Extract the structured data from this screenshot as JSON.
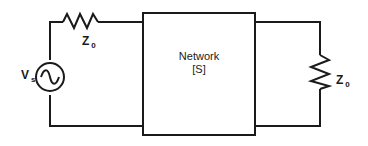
{
  "diagram": {
    "type": "circuit",
    "source": {
      "label": "V",
      "subscript": "s",
      "symbol": "ac-voltage-source"
    },
    "source_impedance": {
      "label": "Z",
      "subscript": "0"
    },
    "network": {
      "line1": "Network",
      "line2": "[S]"
    },
    "load_impedance": {
      "label": "Z",
      "subscript": "0"
    },
    "colors": {
      "line": "#1a1a1a",
      "background": "#ffffff"
    }
  }
}
